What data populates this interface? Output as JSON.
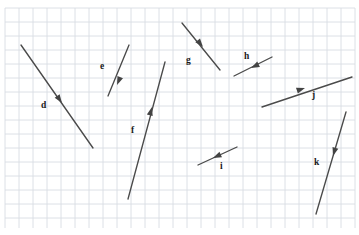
{
  "figure": {
    "background_color": "#ffffff",
    "grid": {
      "line_color": "#d8dce3",
      "cell_size": 14,
      "origin_x": 5,
      "origin_y": 8,
      "right_edge": 355,
      "bottom_edge": 228,
      "columns": 25,
      "rows": 16,
      "visible": true
    },
    "vector_color": "#4a4a4a",
    "arrowhead_color": "#434343",
    "label_color": "#1a1a1a"
  },
  "chart_data": {
    "type": "scatter",
    "xlabel": "",
    "ylabel": "",
    "grid": true,
    "legend": "none",
    "xlim": [
      0,
      359
    ],
    "ylim": [
      0,
      235
    ],
    "units": "grid squares (14 px per square)",
    "vectors": [
      {
        "label": "d",
        "tail_x": 21,
        "tail_y": 45,
        "tip_x": 93,
        "tip_y": 148,
        "head_x": 62,
        "head_y": 103,
        "head_angle_deg": 55,
        "label_x": 41,
        "label_y": 101,
        "direction": "down-right",
        "length_px": 125.7,
        "components": {
          "dx": 72,
          "dy": 103
        }
      },
      {
        "label": "e",
        "tail_x": 129,
        "tail_y": 45,
        "tip_x": 108,
        "tip_y": 96,
        "head_x": 117,
        "head_y": 85,
        "head_angle_deg": 112,
        "label_x": 100,
        "label_y": 62,
        "direction": "down-left",
        "length_px": 55.2,
        "components": {
          "dx": -21,
          "dy": 51
        }
      },
      {
        "label": "f",
        "tail_x": 128,
        "tail_y": 199,
        "tip_x": 165,
        "tip_y": 62,
        "head_x": 152,
        "head_y": 107,
        "head_angle_deg": -75,
        "label_x": 131,
        "label_y": 126,
        "direction": "up-right",
        "length_px": 141.9,
        "components": {
          "dx": 37,
          "dy": -137
        }
      },
      {
        "label": "g",
        "tail_x": 182,
        "tail_y": 23,
        "tip_x": 220,
        "tip_y": 70,
        "head_x": 203,
        "head_y": 47,
        "head_angle_deg": 51,
        "label_x": 186,
        "label_y": 56,
        "direction": "down-right",
        "length_px": 60.4,
        "components": {
          "dx": 38,
          "dy": 47
        }
      },
      {
        "label": "h",
        "tail_x": 272,
        "tail_y": 57,
        "tip_x": 234,
        "tip_y": 76,
        "head_x": 251,
        "head_y": 68,
        "head_angle_deg": 153,
        "label_x": 244,
        "label_y": 52,
        "direction": "down-left",
        "length_px": 42.5,
        "components": {
          "dx": -38,
          "dy": 19
        }
      },
      {
        "label": "i",
        "tail_x": 237,
        "tail_y": 147,
        "tip_x": 198,
        "tip_y": 165,
        "head_x": 213,
        "head_y": 158,
        "head_angle_deg": 155,
        "label_x": 220,
        "label_y": 162,
        "direction": "down-left",
        "length_px": 43.0,
        "components": {
          "dx": -39,
          "dy": 18
        }
      },
      {
        "label": "j",
        "tail_x": 262,
        "tail_y": 107,
        "tip_x": 352,
        "tip_y": 77,
        "head_x": 305,
        "head_y": 88,
        "head_angle_deg": -18,
        "label_x": 312,
        "label_y": 91,
        "direction": "up-right",
        "length_px": 94.9,
        "components": {
          "dx": 90,
          "dy": -30
        }
      },
      {
        "label": "k",
        "tail_x": 346,
        "tail_y": 112,
        "tip_x": 316,
        "tip_y": 214,
        "head_x": 333,
        "head_y": 156,
        "head_angle_deg": 106,
        "label_x": 314,
        "label_y": 158,
        "direction": "down-left",
        "length_px": 106.3,
        "components": {
          "dx": -30,
          "dy": 102
        }
      }
    ]
  }
}
